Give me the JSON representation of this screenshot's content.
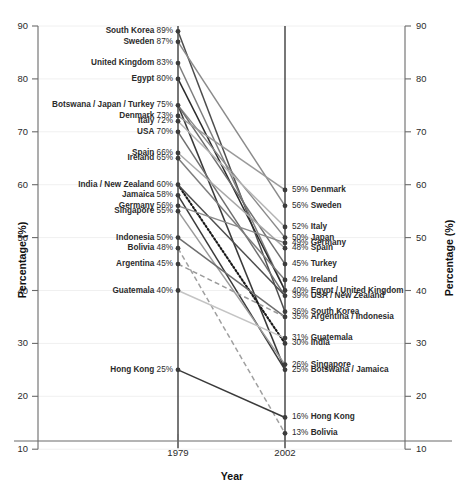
{
  "chart_data": {
    "type": "line",
    "subtype": "slope-graph",
    "title": "",
    "xlabel": "Year",
    "ylabel": "Percentage (%)",
    "ylabel_right": "Percentage (%)",
    "x": [
      "1979",
      "2002"
    ],
    "ylim": [
      10,
      90
    ],
    "yticks": [
      10,
      20,
      30,
      40,
      50,
      60,
      70,
      80,
      90
    ],
    "grid": false,
    "legend": "none",
    "units": "%",
    "series": [
      {
        "name": "South Korea",
        "values": [
          89,
          36
        ],
        "color": "#4d4d4d",
        "style": "solid"
      },
      {
        "name": "Sweden",
        "values": [
          87,
          56
        ],
        "color": "#8a8a8a",
        "style": "solid"
      },
      {
        "name": "United Kingdom",
        "values": [
          83,
          40
        ],
        "color": "#7d7d7d",
        "style": "solid"
      },
      {
        "name": "Egypt",
        "values": [
          80,
          40
        ],
        "color": "#2b2b2b",
        "style": "solid"
      },
      {
        "name": "Botswana",
        "values": [
          75,
          25
        ],
        "color": "#3a3a3a",
        "style": "solid"
      },
      {
        "name": "Japan",
        "values": [
          75,
          50
        ],
        "color": "#8a8a8a",
        "style": "solid"
      },
      {
        "name": "Turkey",
        "values": [
          75,
          45
        ],
        "color": "#6e6e6e",
        "style": "solid"
      },
      {
        "name": "Denmark",
        "values": [
          73,
          59
        ],
        "color": "#9a9a9a",
        "style": "solid"
      },
      {
        "name": "Italy",
        "values": [
          72,
          52
        ],
        "color": "#b4b4b4",
        "style": "solid"
      },
      {
        "name": "USA",
        "values": [
          70,
          39
        ],
        "color": "#6e6e6e",
        "style": "solid"
      },
      {
        "name": "Spain",
        "values": [
          66,
          48
        ],
        "color": "#a8a8a8",
        "style": "solid"
      },
      {
        "name": "Ireland",
        "values": [
          65,
          42
        ],
        "color": "#7d7d7d",
        "style": "solid"
      },
      {
        "name": "India",
        "values": [
          60,
          30
        ],
        "color": "#1a1a1a",
        "style": "dotted"
      },
      {
        "name": "New Zealand",
        "values": [
          60,
          39
        ],
        "color": "#4d4d4d",
        "style": "solid"
      },
      {
        "name": "Jamaica",
        "values": [
          58,
          25
        ],
        "color": "#3a3a3a",
        "style": "solid"
      },
      {
        "name": "Germany",
        "values": [
          56,
          49
        ],
        "color": "#8a8a8a",
        "style": "solid"
      },
      {
        "name": "Singapore",
        "values": [
          55,
          26
        ],
        "color": "#9a9a9a",
        "style": "solid"
      },
      {
        "name": "Indonesia",
        "values": [
          50,
          35
        ],
        "color": "#6e6e6e",
        "style": "solid"
      },
      {
        "name": "Bolivia",
        "values": [
          48,
          13
        ],
        "color": "#a0a0a0",
        "style": "dashed"
      },
      {
        "name": "Argentina",
        "values": [
          45,
          35
        ],
        "color": "#9a9a9a",
        "style": "dashed"
      },
      {
        "name": "Guatemala",
        "values": [
          40,
          31
        ],
        "color": "#c4c4c4",
        "style": "solid"
      },
      {
        "name": "Hong Kong",
        "values": [
          25,
          16
        ],
        "color": "#3a3a3a",
        "style": "solid"
      }
    ]
  },
  "axes": {
    "left_title": "Percentage (%)",
    "right_title": "Percentage (%)",
    "x_title": "Year",
    "ticks": [
      "90",
      "80",
      "70",
      "60",
      "50",
      "40",
      "30",
      "20",
      "10"
    ],
    "x_ticks": [
      "1979",
      "2002"
    ]
  },
  "left_labels": [
    {
      "name": "South Korea",
      "pct": "89%",
      "value": 89
    },
    {
      "name": "Sweden",
      "pct": "87%",
      "value": 87
    },
    {
      "name": "United Kingdom",
      "pct": "83%",
      "value": 83
    },
    {
      "name": "Egypt",
      "pct": "80%",
      "value": 80
    },
    {
      "name": "Botswana / Japan / Turkey",
      "pct": "75%",
      "value": 75
    },
    {
      "name": "Denmark",
      "pct": "73%",
      "value": 73
    },
    {
      "name": "Italy",
      "pct": "72%",
      "value": 72
    },
    {
      "name": "USA",
      "pct": "70%",
      "value": 70
    },
    {
      "name": "Spain",
      "pct": "66%",
      "value": 66
    },
    {
      "name": "Ireland",
      "pct": "65%",
      "value": 65
    },
    {
      "name": "India / New Zealand",
      "pct": "60%",
      "value": 60
    },
    {
      "name": "Jamaica",
      "pct": "58%",
      "value": 58
    },
    {
      "name": "Germany",
      "pct": "56%",
      "value": 56
    },
    {
      "name": "Singapore",
      "pct": "55%",
      "value": 55
    },
    {
      "name": "Indonesia",
      "pct": "50%",
      "value": 50
    },
    {
      "name": "Bolivia",
      "pct": "48%",
      "value": 48
    },
    {
      "name": "Argentina",
      "pct": "45%",
      "value": 45
    },
    {
      "name": "Guatemala",
      "pct": "40%",
      "value": 40
    },
    {
      "name": "Hong Kong",
      "pct": "25%",
      "value": 25
    }
  ],
  "right_labels": [
    {
      "pct": "59%",
      "name": "Denmark",
      "value": 59
    },
    {
      "pct": "56%",
      "name": "Sweden",
      "value": 56
    },
    {
      "pct": "52%",
      "name": "Italy",
      "value": 52
    },
    {
      "pct": "50%",
      "name": "Japan",
      "value": 50
    },
    {
      "pct": "49%",
      "name": "Germany",
      "value": 49
    },
    {
      "pct": "48%",
      "name": "Spain",
      "value": 48
    },
    {
      "pct": "45%",
      "name": "Turkey",
      "value": 45
    },
    {
      "pct": "42%",
      "name": "Ireland",
      "value": 42
    },
    {
      "pct": "40%",
      "name": "Egypt / United Kingdom",
      "value": 40
    },
    {
      "pct": "39%",
      "name": "USA / New Zealand",
      "value": 39
    },
    {
      "pct": "36%",
      "name": "South Korea",
      "value": 36
    },
    {
      "pct": "35%",
      "name": "Argentina / Indonesia",
      "value": 35
    },
    {
      "pct": "31%",
      "name": "Guatemala",
      "value": 31
    },
    {
      "pct": "30%",
      "name": "India",
      "value": 30
    },
    {
      "pct": "26%",
      "name": "Singapore",
      "value": 26
    },
    {
      "pct": "25%",
      "name": "Botswana / Jamaica",
      "value": 25
    },
    {
      "pct": "16%",
      "name": "Hong Kong",
      "value": 16
    },
    {
      "pct": "13%",
      "name": "Bolivia",
      "value": 13
    }
  ],
  "geometry": {
    "x1979": 178,
    "x2002": 285,
    "y_top_value": 90,
    "y_top_px": 26,
    "px_per_unit": 5.29
  }
}
